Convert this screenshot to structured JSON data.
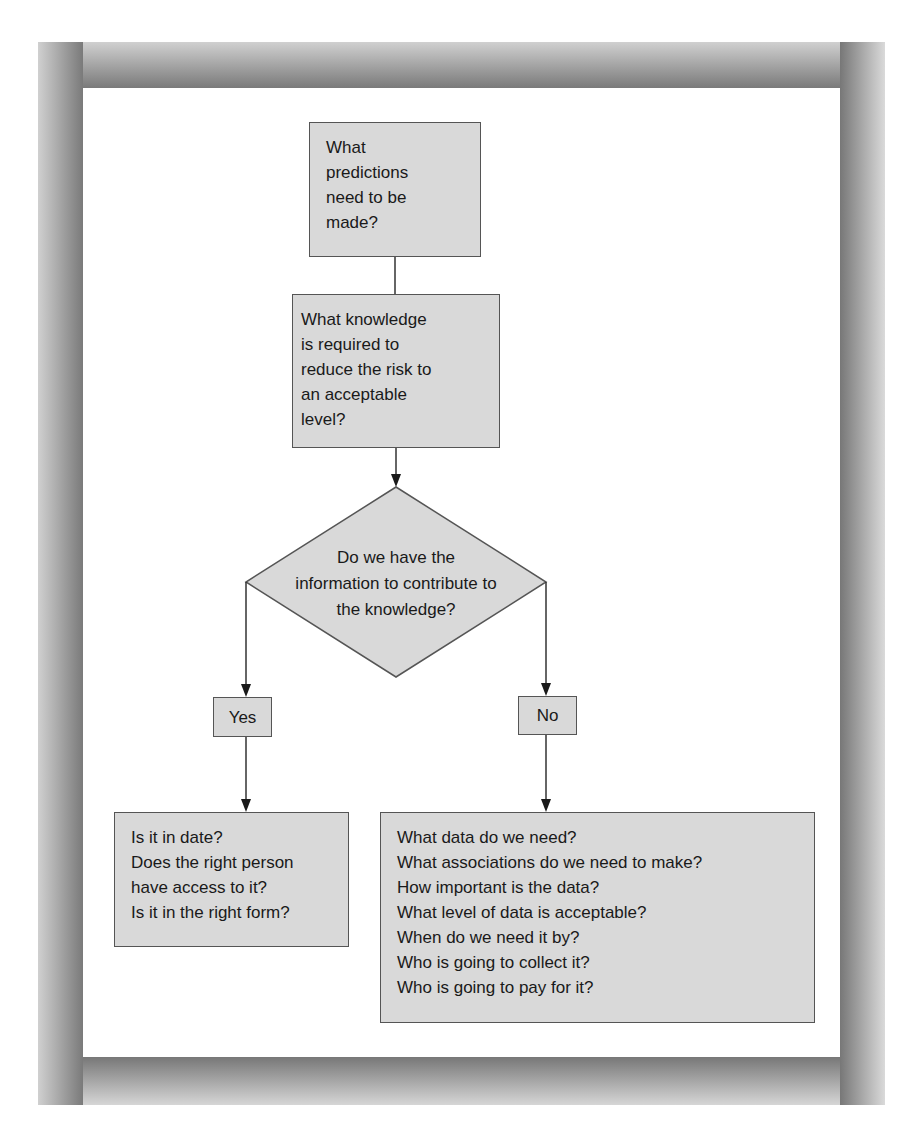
{
  "diagram": {
    "type": "flowchart",
    "nodes": {
      "predictions": {
        "shape": "rectangle",
        "lines": [
          "What",
          "predictions",
          "need to be",
          "made?"
        ]
      },
      "knowledge": {
        "shape": "rectangle",
        "lines": [
          "What knowledge",
          "is required to",
          "reduce the risk to",
          "an acceptable",
          "level?"
        ]
      },
      "decision": {
        "shape": "diamond",
        "lines": [
          "Do we have the",
          "information to contribute to",
          "the knowledge?"
        ]
      },
      "yes": {
        "shape": "rectangle",
        "label": "Yes"
      },
      "no": {
        "shape": "rectangle",
        "label": "No"
      },
      "yes_detail": {
        "shape": "rectangle",
        "lines": [
          "Is it in date?",
          "Does the right person",
          "have access to it?",
          "Is it in the right form?"
        ]
      },
      "no_detail": {
        "shape": "rectangle",
        "lines": [
          "What data do we need?",
          "What associations do we need to make?",
          "How important is the data?",
          "What level of data is acceptable?",
          "When do we need it by?",
          "Who is going to collect it?",
          "Who is going to pay for it?"
        ]
      }
    },
    "edges": [
      {
        "from": "predictions",
        "to": "knowledge",
        "arrow": false
      },
      {
        "from": "knowledge",
        "to": "decision",
        "arrow": true
      },
      {
        "from": "decision",
        "to": "yes",
        "arrow": true
      },
      {
        "from": "decision",
        "to": "no",
        "arrow": true
      },
      {
        "from": "yes",
        "to": "yes_detail",
        "arrow": true
      },
      {
        "from": "no",
        "to": "no_detail",
        "arrow": true
      }
    ],
    "colors": {
      "box_fill": "#d9d9d9",
      "box_border": "#555555",
      "frame": "#8a8a8a",
      "panel": "#ffffff"
    }
  }
}
